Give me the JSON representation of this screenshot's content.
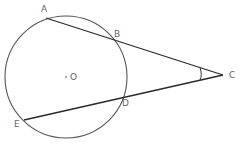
{
  "diagram": {
    "type": "geometry",
    "circle": {
      "center_label": "O"
    },
    "points": [
      {
        "id": "A",
        "label": "A",
        "on_circle": true
      },
      {
        "id": "B",
        "label": "B",
        "on_circle": true
      },
      {
        "id": "C",
        "label": "C",
        "on_circle": false
      },
      {
        "id": "D",
        "label": "D",
        "on_circle": true
      },
      {
        "id": "E",
        "label": "E",
        "on_circle": true
      },
      {
        "id": "O",
        "label": "O",
        "on_circle": false
      }
    ],
    "segments": [
      {
        "from": "A",
        "to": "C"
      },
      {
        "from": "E",
        "to": "C"
      }
    ],
    "angle_marks": [
      {
        "vertex": "C",
        "between": [
          "A",
          "E"
        ]
      }
    ],
    "colors": {
      "line": "#2a2a2a",
      "circle": "#555555",
      "label": "#666666",
      "background": "#ffffff"
    }
  }
}
